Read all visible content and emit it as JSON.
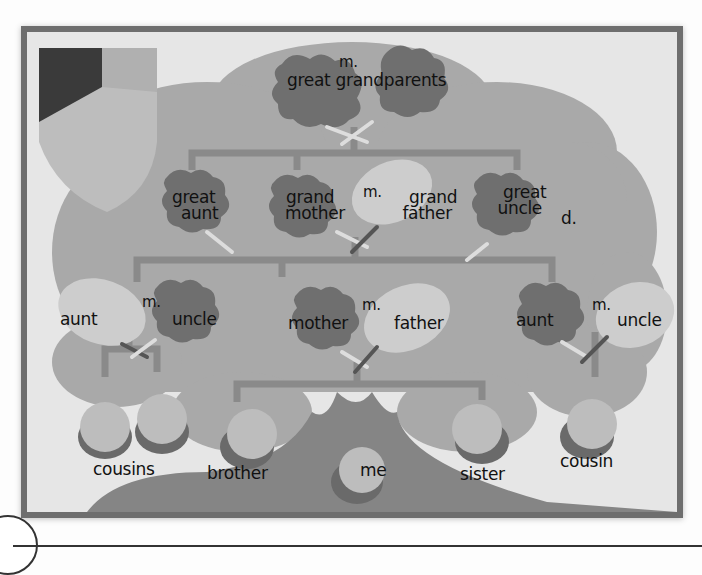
{
  "colors": {
    "frame": "#6e6e6e",
    "panel": "#e6e6e6",
    "canopy": "#a9a9a9",
    "trunk": "#858585",
    "oak_leaf": "#6f6f6f",
    "pale_leaf": "#cdcdcd",
    "branch": "#8a8a8a",
    "acorn_cap": "#6a6a6a",
    "acorn_nut": "#bdbdbd",
    "shield_dark": "#3a3a3a",
    "shield_light": "#bdbdbd"
  },
  "tree": {
    "generation_1": {
      "label": "great grandparents",
      "marriage": "m."
    },
    "generation_2": [
      {
        "label_line1": "great",
        "label_line2": "aunt"
      },
      {
        "label_line1": "grand",
        "label_line2": "mother"
      },
      {
        "marriage": "m."
      },
      {
        "label_line1": "grand",
        "label_line2": "father"
      },
      {
        "label_line1": "great",
        "label_line2": "uncle",
        "note": "d."
      }
    ],
    "generation_3": [
      {
        "left": "aunt",
        "marriage": "m.",
        "right": "uncle"
      },
      {
        "left": "mother",
        "marriage": "m.",
        "right": "father"
      },
      {
        "left": "aunt",
        "marriage": "m.",
        "right": "uncle"
      }
    ],
    "generation_4": {
      "cousins": "cousins",
      "brother": "brother",
      "me": "me",
      "sister": "sister",
      "cousin": "cousin"
    }
  }
}
